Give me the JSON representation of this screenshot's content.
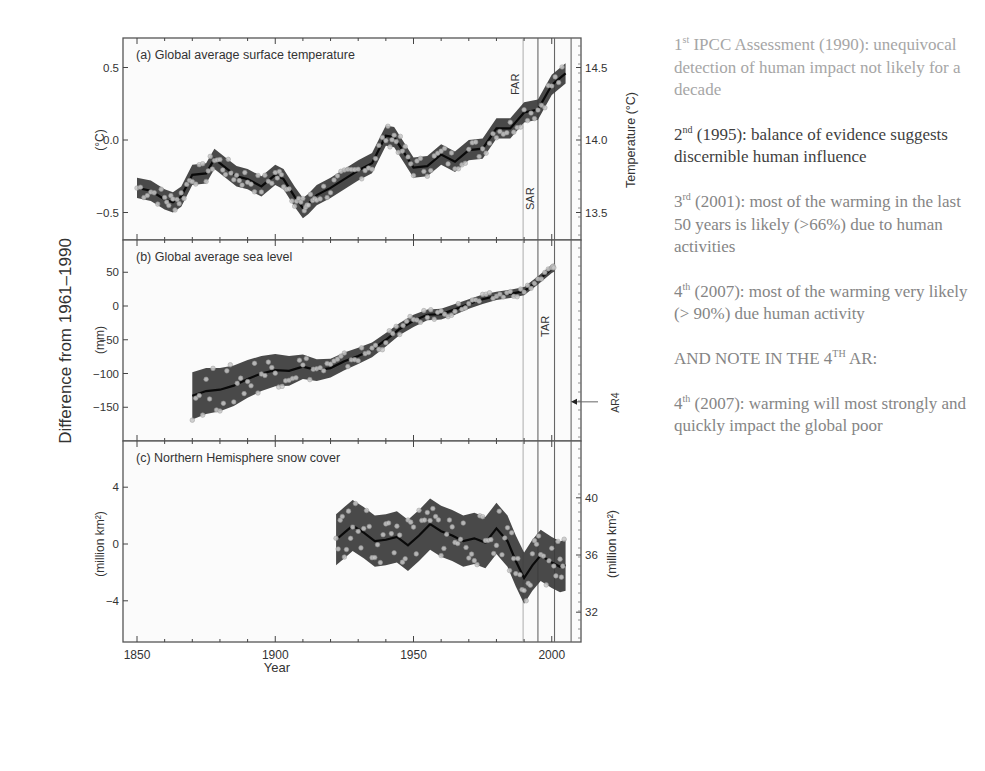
{
  "chart_data": [
    {
      "type": "line",
      "panel": "a",
      "title": "(a) Global average surface temperature",
      "xlabel": "Year",
      "ylabel": "(°C)",
      "ylabel_right": "Temperature (°C)",
      "xlim": [
        1850,
        2007
      ],
      "ylim": [
        -0.7,
        0.7
      ],
      "yticks": [
        -0.5,
        0.0,
        0.5
      ],
      "yticklabels": [
        "-0.5",
        "0.0",
        "0.5"
      ],
      "yticks_right": [
        13.5,
        14.0,
        14.5
      ],
      "yticklabels_right": [
        "13.5",
        "14.0",
        "14.5"
      ],
      "series": [
        {
          "name": "smoothed decadal anomaly",
          "x": [
            1850,
            1855,
            1860,
            1863,
            1866,
            1870,
            1875,
            1878,
            1882,
            1886,
            1890,
            1895,
            1900,
            1903,
            1907,
            1910,
            1912,
            1915,
            1920,
            1925,
            1930,
            1935,
            1940,
            1943,
            1946,
            1950,
            1955,
            1960,
            1965,
            1970,
            1975,
            1980,
            1985,
            1990,
            1995,
            2000,
            2005
          ],
          "y": [
            -0.33,
            -0.35,
            -0.41,
            -0.43,
            -0.39,
            -0.24,
            -0.23,
            -0.13,
            -0.19,
            -0.25,
            -0.27,
            -0.32,
            -0.24,
            -0.27,
            -0.39,
            -0.47,
            -0.44,
            -0.38,
            -0.33,
            -0.27,
            -0.21,
            -0.16,
            0.03,
            0.02,
            -0.07,
            -0.19,
            -0.18,
            -0.1,
            -0.15,
            -0.07,
            -0.06,
            0.08,
            0.08,
            0.19,
            0.21,
            0.38,
            0.46
          ],
          "band_halfwidth": 0.07
        }
      ],
      "vlines": [
        1990,
        1995,
        2001,
        2007
      ],
      "vline_labels": [
        "FAR",
        "SAR",
        "TAR",
        "AR4"
      ]
    },
    {
      "type": "line",
      "panel": "b",
      "title": "(b) Global average sea level",
      "ylabel": "(mm)",
      "ylim": [
        -195,
        95
      ],
      "yticks": [
        -150,
        -100,
        -50,
        0,
        50
      ],
      "yticklabels": [
        "-150",
        "-100",
        "-50",
        "0",
        "50"
      ],
      "series": [
        {
          "name": "sea level anomaly",
          "x": [
            1870,
            1875,
            1880,
            1885,
            1890,
            1895,
            1900,
            1905,
            1910,
            1915,
            1920,
            1925,
            1930,
            1935,
            1940,
            1945,
            1950,
            1955,
            1960,
            1965,
            1970,
            1975,
            1980,
            1985,
            1990,
            1995,
            2000,
            2001
          ],
          "y": [
            -133,
            -126,
            -124,
            -118,
            -108,
            -100,
            -95,
            -96,
            -90,
            -95,
            -92,
            -82,
            -74,
            -65,
            -50,
            -34,
            -22,
            -13,
            -12,
            -5,
            3,
            10,
            15,
            18,
            22,
            38,
            55,
            57
          ],
          "band_lower_halfwidth": [
            35,
            34,
            32,
            30,
            28,
            26,
            24,
            22,
            18,
            16,
            14,
            13,
            12,
            11,
            10,
            9,
            9,
            8,
            8,
            8,
            7,
            7,
            6,
            6,
            6,
            6,
            6,
            6
          ]
        }
      ],
      "annotation": {
        "text": "AR4",
        "arrow_y": -142
      }
    },
    {
      "type": "line",
      "panel": "c",
      "title": "(c) Northern Hemisphere snow cover",
      "ylabel": "(million km²)",
      "ylabel_right": "(million km²)",
      "ylim": [
        -6.5,
        7.5
      ],
      "yticks": [
        -4,
        0,
        4
      ],
      "yticklabels": [
        "-4",
        "0",
        "4"
      ],
      "yticks_right": [
        32,
        36,
        40
      ],
      "yticklabels_right": [
        "32",
        "36",
        "40"
      ],
      "series": [
        {
          "name": "snow cover anomaly",
          "x": [
            1922,
            1925,
            1928,
            1932,
            1936,
            1940,
            1944,
            1948,
            1952,
            1956,
            1960,
            1964,
            1968,
            1972,
            1976,
            1980,
            1984,
            1987,
            1990,
            1993,
            1996,
            2000,
            2003,
            2005
          ],
          "y": [
            0.3,
            0.8,
            1.3,
            0.8,
            0.2,
            0.3,
            0.5,
            -0.1,
            0.6,
            1.4,
            0.9,
            0.6,
            0.2,
            0.4,
            0.1,
            1.1,
            0.2,
            -1.2,
            -2.4,
            -1.5,
            -0.8,
            -1.3,
            -1.6,
            -1.5
          ],
          "band_halfwidth": 1.8
        }
      ]
    }
  ],
  "figure": {
    "shared_ylabel": "Difference from 1961–1990",
    "xticklabels": [
      "1850",
      "1900",
      "1950",
      "2000"
    ],
    "xlabel": "Year"
  },
  "notes": [
    {
      "sup_num": "1",
      "sup": "st",
      "text": " IPCC Assessment (1990): unequivocal detection of human impact not likely for a decade",
      "tone": "light"
    },
    {
      "sup_num": "2",
      "sup": "nd",
      "text": " (1995): balance of evidence suggests discernible human influence",
      "tone": "dark"
    },
    {
      "sup_num": "3",
      "sup": "rd",
      "text": " (2001): most of the warming in the last 50 years is likely (>66%) due to human activities",
      "tone": "mid"
    },
    {
      "sup_num": "4",
      "sup": "th",
      "text": " (2007): most of the warming very likely (> 90%) due human activity",
      "tone": "mid"
    },
    {
      "sup_num": "AND NOTE IN THE 4",
      "sup": "TH",
      "text": " AR:",
      "tone": "mid"
    },
    {
      "sup_num": "4",
      "sup": "th",
      "text": " (2007): warming will most strongly and quickly impact the global poor",
      "tone": "mid"
    }
  ],
  "colors": {
    "band": "#3a3a3a",
    "line": "#0a0a0a",
    "frame": "#555555",
    "text": "#333333"
  }
}
